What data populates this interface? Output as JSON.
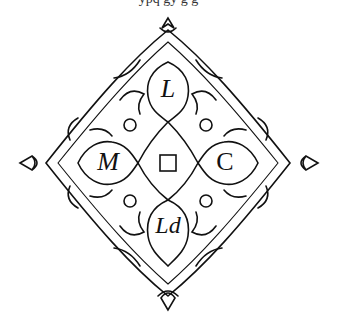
{
  "top_text": "ypq gy g g",
  "monogram": {
    "top": "L",
    "left": "M",
    "right": "C",
    "bottom": "Ld"
  },
  "colors": {
    "ink": "#111111",
    "background": "#ffffff"
  }
}
